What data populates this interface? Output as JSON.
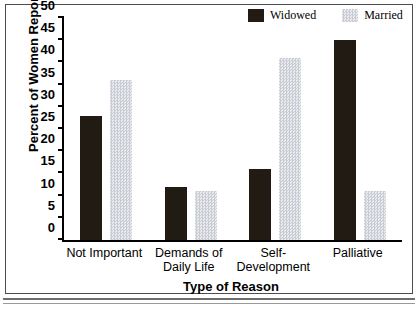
{
  "chart_data": {
    "type": "bar",
    "title": "",
    "xlabel": "Type of Reason",
    "ylabel": "Percent of Women Reporting",
    "categories": [
      "Not Important",
      "Demands of Daily Life",
      "Self-Development",
      "Palliative"
    ],
    "series": [
      {
        "name": "Widowed",
        "color": "#211b14",
        "values": [
          28,
          12,
          16,
          45
        ]
      },
      {
        "name": "Married",
        "color": "#d8dade",
        "values": [
          36,
          11,
          41,
          11
        ]
      }
    ],
    "ylim": [
      0,
      50
    ],
    "yticks": [
      0,
      5,
      10,
      15,
      20,
      25,
      30,
      35,
      40,
      45,
      50
    ],
    "ytick_labels": [
      "0",
      "5",
      "10",
      "15",
      "20",
      "25",
      "30",
      "35",
      "40",
      "45",
      "50"
    ],
    "grid": false,
    "legend_position": "top-right"
  }
}
